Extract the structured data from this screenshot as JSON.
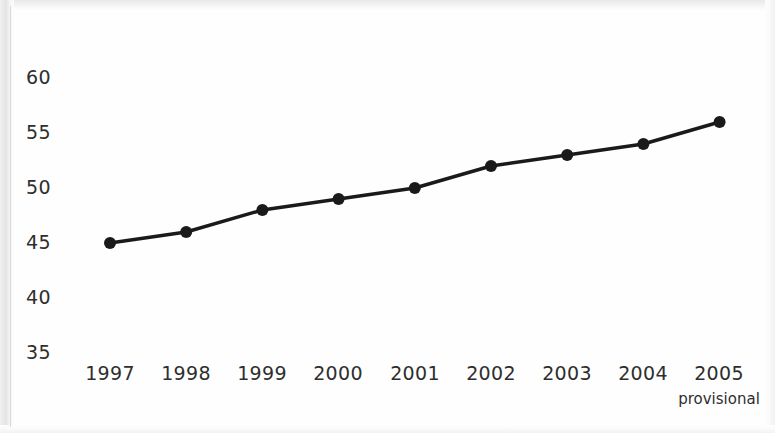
{
  "chart_data": {
    "type": "line",
    "title": "",
    "subtitle": "",
    "xlabel": "",
    "ylabel": "",
    "categories": [
      "1997",
      "1998",
      "1999",
      "2000",
      "2001",
      "2002",
      "2003",
      "2004",
      "2005"
    ],
    "values": [
      45,
      46,
      48,
      49,
      50,
      52,
      53,
      54,
      56
    ],
    "series": [
      {
        "name": "",
        "values": [
          45,
          46,
          48,
          49,
          50,
          52,
          53,
          54,
          56
        ]
      }
    ],
    "ylim": [
      35,
      60
    ],
    "yticks": [
      "35",
      "40",
      "45",
      "50",
      "55",
      "60"
    ],
    "ytick_values": [
      35,
      40,
      45,
      50,
      55,
      60
    ],
    "xticks": [
      "1997",
      "1998",
      "1999",
      "2000",
      "2001",
      "2002",
      "2003",
      "2004",
      "2005"
    ],
    "x_tick_notes": [
      "",
      "",
      "",
      "",
      "",
      "",
      "",
      "",
      "provisional"
    ],
    "grid": false,
    "legend": false,
    "legend_position": "none",
    "annotations": [
      "provisional"
    ],
    "line_color": "#1a1a1a",
    "marker_color": "#1a1a1a",
    "marker": "circle",
    "background_color": "#fefefe",
    "text_color": "#2e2e2e"
  }
}
